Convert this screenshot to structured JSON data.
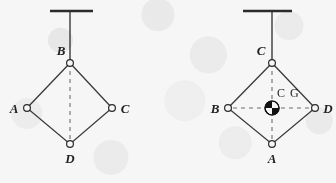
{
  "figure": {
    "background_color": "#f6f6f6",
    "ink_color": "#2b2b2b",
    "dash_color": "#6f6f6f",
    "panels": [
      {
        "id": "left-panel",
        "name": "suspended-from-b",
        "support": {
          "ceiling_y": 11,
          "ceiling_x1": 50,
          "ceiling_x2": 93,
          "string_x": 70,
          "string_y1": 11,
          "string_y2": 63
        },
        "vertices": [
          {
            "label": "B",
            "role": "suspension-point",
            "cx": 70,
            "cy": 63,
            "label_x": 61,
            "label_y": 55,
            "anchor": "middle"
          },
          {
            "label": "A",
            "role": "corner",
            "cx": 27,
            "cy": 108,
            "label_x": 14,
            "label_y": 113,
            "anchor": "middle"
          },
          {
            "label": "C",
            "role": "corner",
            "cx": 112,
            "cy": 108,
            "label_x": 125,
            "label_y": 113,
            "anchor": "middle"
          },
          {
            "label": "D",
            "role": "corner",
            "cx": 70,
            "cy": 144,
            "label_x": 70,
            "label_y": 163,
            "anchor": "middle"
          }
        ],
        "plumb_line": {
          "x1": 70,
          "y1": 63,
          "x2": 70,
          "y2": 144,
          "style": "dashed"
        },
        "cg_marker": null,
        "cg_label": null
      },
      {
        "id": "right-panel",
        "name": "suspended-from-c",
        "support": {
          "ceiling_y": 11,
          "ceiling_x1": 243,
          "ceiling_x2": 292,
          "string_x": 272,
          "string_y1": 11,
          "string_y2": 63
        },
        "vertices": [
          {
            "label": "C",
            "role": "suspension-point",
            "cx": 272,
            "cy": 63,
            "label_x": 261,
            "label_y": 55,
            "anchor": "middle"
          },
          {
            "label": "B",
            "role": "corner",
            "cx": 228,
            "cy": 108,
            "label_x": 215,
            "label_y": 113,
            "anchor": "middle"
          },
          {
            "label": "D",
            "role": "corner",
            "cx": 315,
            "cy": 108,
            "label_x": 328,
            "label_y": 113,
            "anchor": "middle"
          },
          {
            "label": "A",
            "role": "corner",
            "cx": 272,
            "cy": 144,
            "label_x": 272,
            "label_y": 163,
            "anchor": "middle"
          }
        ],
        "plumb_line": {
          "x1": 272,
          "y1": 63,
          "x2": 272,
          "y2": 144,
          "style": "dashed"
        },
        "cross_line": {
          "x1": 228,
          "y1": 108,
          "x2": 315,
          "y2": 108,
          "style": "dashed"
        },
        "cg_marker": {
          "cx": 272,
          "cy": 108,
          "r": 7,
          "quadrants": "black-upper-left-and-lower-right"
        },
        "cg_label": {
          "text": "C G",
          "x": 277,
          "y": 97
        }
      }
    ]
  }
}
